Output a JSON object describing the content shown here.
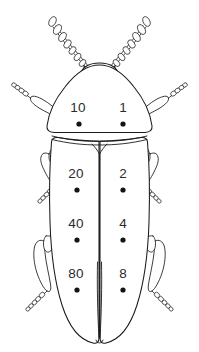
{
  "figure": {
    "view": "dorsal",
    "line_color": "#1a1a1a",
    "background_color": "#ffffff",
    "dot_color": "#141414",
    "label_color": "#2b2b2b"
  },
  "spots": {
    "pronotum": [
      {
        "id": "spot-10",
        "label": "10",
        "side": "left",
        "region": "pronotum",
        "label_x": 78,
        "label_y": 112,
        "dot_x": 79,
        "dot_y": 124,
        "dot_r": 2.6
      },
      {
        "id": "spot-1",
        "label": "1",
        "side": "right",
        "region": "pronotum",
        "label_x": 123,
        "label_y": 112,
        "dot_x": 123,
        "dot_y": 124,
        "dot_r": 2.6
      }
    ],
    "elytra": [
      {
        "id": "spot-20",
        "label": "20",
        "side": "left",
        "region": "elytra",
        "label_x": 76,
        "label_y": 178,
        "dot_x": 77,
        "dot_y": 190,
        "dot_r": 2.6
      },
      {
        "id": "spot-2",
        "label": "2",
        "side": "right",
        "region": "elytra",
        "label_x": 123,
        "label_y": 178,
        "dot_x": 123,
        "dot_y": 190,
        "dot_r": 2.6
      },
      {
        "id": "spot-40",
        "label": "40",
        "side": "left",
        "region": "elytra",
        "label_x": 76,
        "label_y": 228,
        "dot_x": 77,
        "dot_y": 240,
        "dot_r": 2.6
      },
      {
        "id": "spot-4",
        "label": "4",
        "side": "right",
        "region": "elytra",
        "label_x": 123,
        "label_y": 228,
        "dot_x": 123,
        "dot_y": 240,
        "dot_r": 2.6
      },
      {
        "id": "spot-80",
        "label": "80",
        "side": "left",
        "region": "elytra",
        "label_x": 76,
        "label_y": 278,
        "dot_x": 77,
        "dot_y": 290,
        "dot_r": 2.6
      },
      {
        "id": "spot-8",
        "label": "8",
        "side": "right",
        "region": "elytra",
        "label_x": 123,
        "label_y": 278,
        "dot_x": 123,
        "dot_y": 290,
        "dot_r": 2.6
      }
    ]
  },
  "anatomy": {
    "head": "head-outline",
    "pronotum": "pronotum-outline",
    "elytra_left": "left-elytron-outline",
    "elytra_right": "right-elytron-outline",
    "scutellum": "scutellum-notch",
    "antennae": [
      "left-antenna",
      "right-antenna"
    ],
    "legs": [
      "front-left-leg",
      "front-right-leg",
      "middle-left-leg",
      "middle-right-leg",
      "hind-left-leg",
      "hind-right-leg"
    ]
  }
}
